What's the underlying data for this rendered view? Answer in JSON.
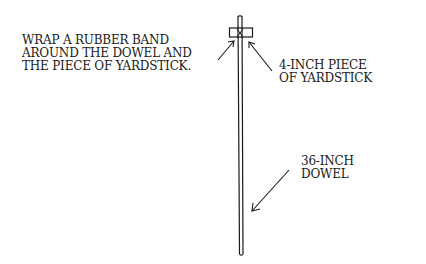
{
  "diagram": {
    "labels": {
      "rubber_band": [
        "WRAP A RUBBER BAND",
        "AROUND THE DOWEL AND",
        "THE PIECE OF YARDSTICK."
      ],
      "yardstick_piece": [
        "4-INCH PIECE",
        "OF YARDSTICK"
      ],
      "dowel": [
        "36-INCH",
        "DOWEL"
      ]
    },
    "colors": {
      "ink": "#1a1a1a",
      "background": "#ffffff"
    }
  }
}
